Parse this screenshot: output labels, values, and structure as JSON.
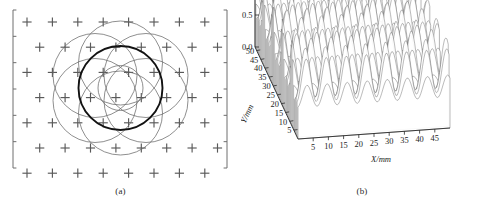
{
  "figure": {
    "panels": [
      {
        "id": "a",
        "caption": "(a)",
        "kind": "lattice-interference-diagram"
      },
      {
        "id": "b",
        "caption": "(b)",
        "kind": "3d-surface-waterfall"
      }
    ]
  },
  "panel_a": {
    "caption": "(a)",
    "description": "Hexagonal lattice of plus-shaped markers overlaid with seven circles: one bold central circle and six thin surrounding circles, plus one thin inner circle.",
    "marker_glyph": "plus-marker",
    "lattice": {
      "type": "staggered-hexagonal",
      "rows": 7,
      "columns_even_row": 8,
      "columns_odd_row": 8,
      "col_spacing": 25.4,
      "row_spacing": 25.2,
      "row_offset": 12.7,
      "origin_x": 27.0,
      "origin_y": 22.0,
      "marker_arm": 4.6
    },
    "frame": {
      "left_x": 13.0,
      "right_x": 227.0,
      "top_y": 10.0,
      "bottom_y": 168.0,
      "tick_count": 7,
      "tick_length": 3.4
    },
    "circles": [
      {
        "name": "center-bold",
        "cx": 120.5,
        "cy": 88.0,
        "r": 42.0,
        "bold": true
      },
      {
        "name": "inner-thin",
        "cx": 120.5,
        "cy": 88.0,
        "r": 22.5,
        "bold": false
      },
      {
        "name": "ring-0",
        "cx": 146.0,
        "cy": 75.5,
        "r": 42.0,
        "bold": false
      },
      {
        "name": "ring-1",
        "cx": 146.0,
        "cy": 100.5,
        "r": 42.0,
        "bold": false
      },
      {
        "name": "ring-2",
        "cx": 120.5,
        "cy": 113.0,
        "r": 42.0,
        "bold": false
      },
      {
        "name": "ring-3",
        "cx": 95.0,
        "cy": 100.5,
        "r": 42.0,
        "bold": false
      },
      {
        "name": "ring-4",
        "cx": 95.0,
        "cy": 75.5,
        "r": 42.0,
        "bold": false
      },
      {
        "name": "ring-5",
        "cx": 120.5,
        "cy": 63.0,
        "r": 42.0,
        "bold": false
      }
    ]
  },
  "chart_data": {
    "type": "surface",
    "title": "",
    "subtitle": "",
    "caption": "(b)",
    "xlabel": "X/mm",
    "ylabel": "Y/mm",
    "zlabel": "",
    "xticks": [
      5,
      10,
      15,
      20,
      25,
      30,
      35,
      40,
      45
    ],
    "yticks": [
      50,
      45,
      40,
      35,
      30,
      25,
      20,
      15,
      10,
      5
    ],
    "zticks": [
      "1.5",
      "1.0",
      "0.5",
      "0.0"
    ],
    "xlim": [
      0,
      50
    ],
    "ylim": [
      0,
      52
    ],
    "zlim": [
      0.0,
      1.5
    ],
    "grid": false,
    "legend": null,
    "projection": "isometric-waterfall",
    "mesh": {
      "y_traces": 50,
      "x_samples": 121,
      "peak_lattice": "hexagonal",
      "peak_spacing_x": 6.6,
      "peak_spacing_y": 5.7,
      "peak_amplitude": 1.35,
      "peak_width": 1.85,
      "baseline": 0.0
    },
    "annotations": []
  }
}
